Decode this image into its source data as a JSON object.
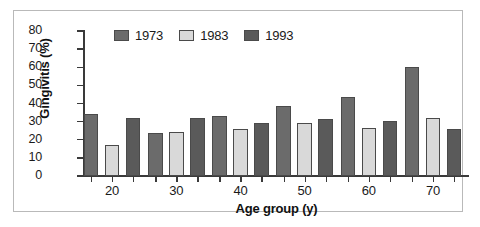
{
  "chart_data": {
    "type": "bar",
    "title": "",
    "xlabel": "Age group (y)",
    "ylabel": "Gingivitis (%)",
    "categories": [
      "20",
      "30",
      "40",
      "50",
      "60",
      "70"
    ],
    "series": [
      {
        "name": "1973",
        "color": "#6b6b6b",
        "values": [
          34,
          24,
          33,
          38.5,
          43.5,
          60
        ]
      },
      {
        "name": "1983",
        "color": "#d9d9d9",
        "values": [
          17,
          24.5,
          26,
          29,
          26.5,
          32
        ]
      },
      {
        "name": "1993",
        "color": "#5a5a5a",
        "values": [
          32,
          32,
          29,
          31.5,
          30.5,
          26
        ]
      }
    ],
    "ylim": [
      0,
      80
    ],
    "yticks": [
      0,
      10,
      20,
      30,
      40,
      50,
      60,
      70,
      80
    ],
    "ytick_labels": [
      "0",
      "10",
      "20",
      "30",
      "40",
      "50",
      "60",
      "70",
      "80"
    ],
    "grid": false,
    "legend_position": "top-left-inside"
  },
  "legend": {
    "entries": [
      {
        "label": "1973"
      },
      {
        "label": "1983"
      },
      {
        "label": "1993"
      }
    ]
  },
  "axes": {
    "x_title": "Age group (y)",
    "y_title": "Gingivitis (%)"
  },
  "colors": {
    "series_1973": "#6b6b6b",
    "series_1983": "#d9d9d9",
    "series_1993": "#5a5a5a",
    "axis": "#3a3a3a",
    "bar_outline": "#4a4a4a",
    "frame": "#b9b9b9",
    "background": "#ffffff"
  }
}
